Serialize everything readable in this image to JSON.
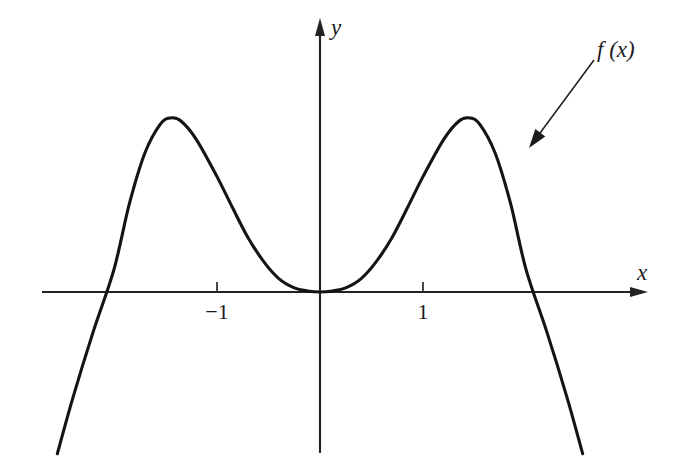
{
  "figure": {
    "kind": "cartesian-function-plot",
    "background_color": "#ffffff",
    "ink_color": "#1b1b1b",
    "axis_color": "#222222",
    "curve_color": "#141414"
  },
  "labels": {
    "y_axis": "y",
    "x_axis": "x",
    "function": "f (x)"
  },
  "ticks": {
    "x": [
      {
        "value": -1,
        "label": "−1"
      },
      {
        "value": 1,
        "label": "1"
      }
    ],
    "y": []
  },
  "annotation": {
    "text": "f (x)",
    "leader_from": {
      "x": 594,
      "y": 60
    },
    "leader_to": {
      "x": 529,
      "y": 148
    },
    "arrow_head": "solid-triangle"
  },
  "chart_data": {
    "type": "line",
    "title": "",
    "subtitle": "",
    "xlabel": "x",
    "ylabel": "y",
    "grid": false,
    "legend_position": "inline-annotation",
    "legend_entries": [
      "f (x)"
    ],
    "xlim": [
      -2.55,
      3.18
    ],
    "ylim": [
      -1.57,
      2.66
    ],
    "axis_arrows": {
      "x": "right",
      "y": "up"
    },
    "expression_note": "quartic with negative leading coefficient; double root at x = 0",
    "features": {
      "roots": [
        -1.4,
        0.0,
        1.4
      ],
      "double_root_at": 0.0,
      "local_maxima": [
        {
          "x": -1.45,
          "y": 1.69
        },
        {
          "x": 1.45,
          "y": 1.69
        }
      ],
      "local_minima": [
        {
          "x": 0.0,
          "y": 0.0
        }
      ],
      "tangent_to_x_axis_at_origin": true,
      "end_behavior": {
        "left": "decreasing to -infinity",
        "right": "decreasing to -infinity"
      }
    },
    "series": [
      {
        "name": "f (x)",
        "x": [
          -2.55,
          -2.4,
          -2.2,
          -2.0,
          -1.85,
          -1.7,
          -1.55,
          -1.45,
          -1.35,
          -1.2,
          -1.0,
          -0.85,
          -0.7,
          -0.55,
          -0.4,
          -0.25,
          -0.12,
          0.0,
          0.12,
          0.25,
          0.4,
          0.55,
          0.7,
          0.85,
          1.0,
          1.2,
          1.35,
          1.45,
          1.55,
          1.7,
          1.85,
          2.0,
          2.2,
          2.4,
          2.55
        ],
        "y": [
          -1.57,
          -1.03,
          -0.38,
          0.22,
          0.86,
          1.35,
          1.63,
          1.69,
          1.66,
          1.48,
          1.12,
          0.82,
          0.53,
          0.3,
          0.13,
          0.04,
          0.01,
          0.0,
          0.01,
          0.04,
          0.13,
          0.3,
          0.53,
          0.82,
          1.12,
          1.48,
          1.66,
          1.69,
          1.63,
          1.35,
          0.86,
          0.22,
          -0.38,
          -1.03,
          -1.57
        ]
      }
    ]
  },
  "geometry": {
    "origin_px": {
      "x": 320,
      "y": 292
    },
    "px_per_unit_x": 103,
    "px_per_unit_y": 103,
    "x_axis_span_px": {
      "from": 42,
      "to": 648
    },
    "y_axis_span_px": {
      "from": 18,
      "to": 453
    },
    "tick_length_px": 10,
    "curve_stroke_px": 3.1,
    "axis_stroke_px": 2.1
  }
}
